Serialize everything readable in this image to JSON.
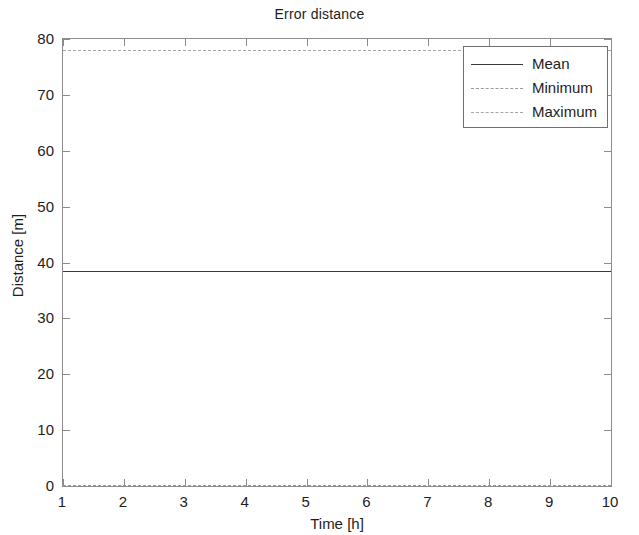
{
  "chart_data": {
    "type": "line",
    "title": "Error distance",
    "xlabel": "Time [h]",
    "ylabel": "Distance [m]",
    "xlim": [
      1,
      10
    ],
    "ylim": [
      0,
      80
    ],
    "x_ticks": [
      "1",
      "2",
      "3",
      "4",
      "5",
      "6",
      "7",
      "8",
      "9",
      "10"
    ],
    "y_ticks": [
      "0",
      "10",
      "20",
      "30",
      "40",
      "50",
      "60",
      "70",
      "80"
    ],
    "x": [
      1,
      2,
      3,
      4,
      5,
      6,
      7,
      8,
      9,
      10
    ],
    "grid": false,
    "legend_position": "upper right",
    "series": [
      {
        "name": "Mean",
        "style": "solid",
        "color": "#3a3a3a",
        "values": [
          38.5,
          38.5,
          38.5,
          38.5,
          38.5,
          38.5,
          38.5,
          38.5,
          38.5,
          38.5
        ],
        "constant_value": 38.5
      },
      {
        "name": "Minimum",
        "style": "dashed",
        "color": "#9a9a9a",
        "values": [
          0,
          0,
          0,
          0,
          0,
          0,
          0,
          0,
          0,
          0
        ],
        "constant_value": 0
      },
      {
        "name": "Maximum",
        "style": "dashed",
        "color": "#a5a5a5",
        "values": [
          78,
          78,
          78,
          78,
          78,
          78,
          78,
          78,
          78,
          78
        ],
        "constant_value": 78
      }
    ]
  },
  "legend": {
    "entries": [
      {
        "label": "Mean"
      },
      {
        "label": "Minimum"
      },
      {
        "label": "Maximum"
      }
    ]
  }
}
